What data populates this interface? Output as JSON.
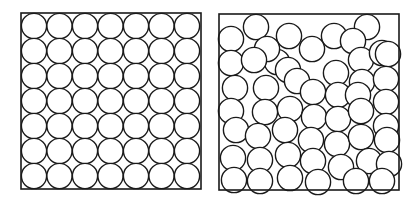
{
  "figure": {
    "width": 419,
    "height": 200,
    "stroke_color": "#1a1a1a",
    "fill_color": "#ffffff",
    "stroke_width": 1.4
  },
  "panels": [
    {
      "id": "ordered",
      "label": "square-lattice-packing",
      "box": {
        "x": 21,
        "y": 13,
        "w": 180,
        "h": 176
      },
      "circle_radius": 12.6,
      "grid": {
        "rows": 7,
        "cols": 7,
        "x0": 34,
        "y0": 26,
        "dx": 25.5,
        "dy": 25
      }
    },
    {
      "id": "disordered",
      "label": "random-packing",
      "box": {
        "x": 219,
        "y": 14,
        "w": 180,
        "h": 176
      },
      "circle_radius": 12.6,
      "circles": [
        [
          256,
          27
        ],
        [
          289,
          36
        ],
        [
          334,
          36
        ],
        [
          367,
          27
        ],
        [
          231,
          39
        ],
        [
          277,
          62
        ],
        [
          267,
          49
        ],
        [
          312,
          49
        ],
        [
          353,
          41
        ],
        [
          361,
          60
        ],
        [
          382,
          53
        ],
        [
          388,
          54
        ],
        [
          231,
          63
        ],
        [
          254,
          60
        ],
        [
          288,
          70
        ],
        [
          336,
          73
        ],
        [
          362,
          82
        ],
        [
          386,
          79
        ],
        [
          235,
          88
        ],
        [
          266,
          88
        ],
        [
          297,
          81
        ],
        [
          313,
          92
        ],
        [
          338,
          95
        ],
        [
          358,
          95
        ],
        [
          386,
          102
        ],
        [
          231,
          111
        ],
        [
          265,
          112
        ],
        [
          290,
          109
        ],
        [
          314,
          117
        ],
        [
          338,
          119
        ],
        [
          361,
          111
        ],
        [
          386,
          126
        ],
        [
          236,
          130
        ],
        [
          258,
          136
        ],
        [
          285,
          130
        ],
        [
          311,
          140
        ],
        [
          337,
          144
        ],
        [
          361,
          137
        ],
        [
          387,
          140
        ],
        [
          233,
          158
        ],
        [
          260,
          160
        ],
        [
          288,
          155
        ],
        [
          313,
          161
        ],
        [
          341,
          167
        ],
        [
          369,
          161
        ],
        [
          389,
          164
        ],
        [
          234,
          180
        ],
        [
          260,
          181
        ],
        [
          290,
          178
        ],
        [
          318,
          182
        ],
        [
          356,
          181
        ],
        [
          382,
          181
        ]
      ]
    }
  ]
}
